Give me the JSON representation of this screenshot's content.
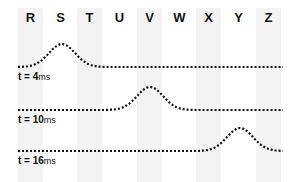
{
  "columns": [
    {
      "letter": "R",
      "x": 18,
      "shaded": true
    },
    {
      "letter": "S",
      "x": 48,
      "shaded": false
    },
    {
      "letter": "T",
      "x": 77,
      "shaded": true
    },
    {
      "letter": "U",
      "x": 107,
      "shaded": false
    },
    {
      "letter": "V",
      "x": 137,
      "shaded": true
    },
    {
      "letter": "W",
      "x": 167,
      "shaded": false
    },
    {
      "letter": "X",
      "x": 196,
      "shaded": true
    },
    {
      "letter": "Y",
      "x": 226,
      "shaded": false
    },
    {
      "letter": "Z",
      "x": 256,
      "shaded": true
    }
  ],
  "rows": [
    {
      "label": "t = 4ms",
      "t_prefix": "t = 4",
      "unit": "ms",
      "baseline_y": 67,
      "peak_x": 62,
      "label_y": 71
    },
    {
      "label": "t = 10ms",
      "t_prefix": "t = 10",
      "unit": "ms",
      "baseline_y": 110,
      "peak_x": 150,
      "label_y": 114
    },
    {
      "label": "t = 16ms",
      "t_prefix": "t = 16",
      "unit": "ms",
      "baseline_y": 151,
      "peak_x": 240,
      "label_y": 155
    }
  ],
  "colors": {
    "shade": "#f3f3f3",
    "ink": "#111111"
  }
}
